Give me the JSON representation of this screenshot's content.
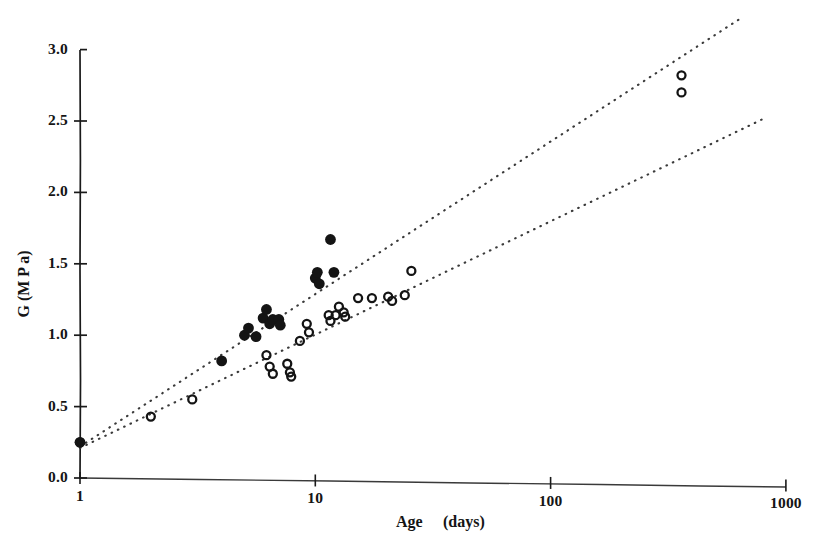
{
  "chart_data": {
    "type": "scatter",
    "title": "",
    "xlabel": "Age   (days)",
    "ylabel": "G   (M P a)",
    "xscale": "log",
    "yscale": "linear",
    "xlim": [
      1,
      1000
    ],
    "ylim": [
      0.0,
      3.0
    ],
    "grid": false,
    "legend_position": "none",
    "x_tick_labels": [
      "1",
      "10",
      "100",
      "1000"
    ],
    "x_tick_values": [
      1,
      10,
      100,
      1000
    ],
    "y_tick_labels": [
      "0.0",
      "0.5",
      "1.0",
      "1.5",
      "2.0",
      "2.5",
      "3.0"
    ],
    "y_tick_values": [
      0.0,
      0.5,
      1.0,
      1.5,
      2.0,
      2.5,
      3.0
    ],
    "marker_colors": {
      "filled": "#141414",
      "open": "#141414",
      "trendline": "#3a3a3a"
    },
    "series": [
      {
        "name": "filled-circles",
        "marker": "filled-circle",
        "points": [
          [
            1,
            0.25
          ],
          [
            4,
            0.82
          ],
          [
            5,
            1.0
          ],
          [
            5.2,
            1.05
          ],
          [
            5.6,
            0.99
          ],
          [
            6,
            1.12
          ],
          [
            6.2,
            1.18
          ],
          [
            6.4,
            1.08
          ],
          [
            6.6,
            1.11
          ],
          [
            7,
            1.11
          ],
          [
            7.1,
            1.07
          ],
          [
            10,
            1.4
          ],
          [
            10.2,
            1.44
          ],
          [
            10.4,
            1.36
          ],
          [
            11.6,
            1.67
          ],
          [
            12,
            1.44
          ]
        ]
      },
      {
        "name": "open-circles",
        "marker": "open-circle",
        "points": [
          [
            1,
            0.25
          ],
          [
            2,
            0.43
          ],
          [
            3,
            0.55
          ],
          [
            6.2,
            0.86
          ],
          [
            6.4,
            0.78
          ],
          [
            6.6,
            0.73
          ],
          [
            7.6,
            0.8
          ],
          [
            7.8,
            0.74
          ],
          [
            7.9,
            0.71
          ],
          [
            8.6,
            0.96
          ],
          [
            9.2,
            1.08
          ],
          [
            9.4,
            1.02
          ],
          [
            11.4,
            1.14
          ],
          [
            11.6,
            1.1
          ],
          [
            12.2,
            1.14
          ],
          [
            12.6,
            1.2
          ],
          [
            13.2,
            1.16
          ],
          [
            13.4,
            1.13
          ],
          [
            15.2,
            1.26
          ],
          [
            17.4,
            1.26
          ],
          [
            20.4,
            1.27
          ],
          [
            21.2,
            1.24
          ],
          [
            24,
            1.28
          ],
          [
            25.6,
            1.45
          ],
          [
            360,
            2.82
          ],
          [
            360,
            2.7
          ]
        ]
      }
    ],
    "trendlines": [
      {
        "name": "upper-trendline",
        "style": "dotted",
        "x1": 1.0,
        "y1": 0.22,
        "x2": 630.0,
        "y2": 3.21
      },
      {
        "name": "lower-trendline",
        "style": "dotted",
        "x1": 1.0,
        "y1": 0.21,
        "x2": 790.0,
        "y2": 2.51
      }
    ]
  },
  "axes": {
    "y_title": "G   (M P a)",
    "x_title_part1": "Age",
    "x_title_part2": "(days)"
  },
  "caption": {
    "text": ""
  }
}
